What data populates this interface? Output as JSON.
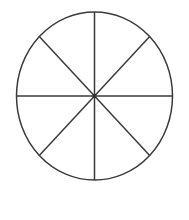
{
  "figure": {
    "background_color": "#ffffff",
    "stroke_color": "#3b3b3b",
    "stroke_width": 1.5,
    "canvas": {
      "width": 189,
      "height": 220
    },
    "caption": ""
  },
  "chart_data": {
    "type": "pie",
    "subtitle": "",
    "xlabel": "",
    "ylabel": "",
    "labels": [
      "Sector 1",
      "Sector 2",
      "Sector 3",
      "Sector 4",
      "Sector 5",
      "Sector 6",
      "Sector 7",
      "Sector 8"
    ],
    "values": [
      12.5,
      12.5,
      12.5,
      12.5,
      12.5,
      12.5,
      12.5,
      12.5
    ],
    "fraction_each": "1/8",
    "slice_count": 8,
    "slice_angle_degrees": 45,
    "colors": [
      "#ffffff",
      "#ffffff",
      "#ffffff",
      "#ffffff",
      "#ffffff",
      "#ffffff",
      "#ffffff",
      "#ffffff"
    ],
    "legend": [],
    "legend_position": "none",
    "grid": false,
    "annotations": [],
    "geometry": {
      "center_x": 94.5,
      "center_y": 96,
      "radius_x": 78,
      "radius_y": 84,
      "divider_angles_degrees": [
        0,
        45,
        90,
        135,
        180,
        225,
        270,
        315
      ]
    }
  },
  "dividers": [
    {
      "name": "vertical-diameter",
      "x1": 94.5,
      "y1": 12,
      "x2": 94.5,
      "y2": 180
    },
    {
      "name": "horizontal-diameter",
      "x1": 16.5,
      "y1": 96,
      "x2": 172.5,
      "y2": 96
    },
    {
      "name": "diagonal-nw-se",
      "x1": 39.3,
      "y1": 36.6,
      "x2": 149.7,
      "y2": 155.4
    },
    {
      "name": "diagonal-ne-sw",
      "x1": 149.7,
      "y1": 36.6,
      "x2": 39.3,
      "y2": 155.4
    }
  ]
}
